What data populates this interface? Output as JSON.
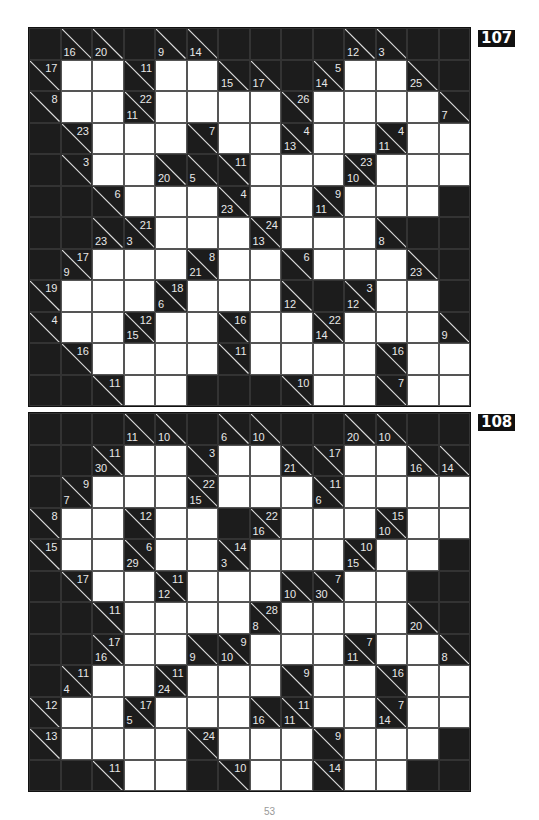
{
  "puzzles": [
    {
      "number": "107",
      "rows": [
        [
          "B",
          {
            "d": "16"
          },
          {
            "d": "20"
          },
          "B",
          {
            "d": "9"
          },
          {
            "d": "14"
          },
          "B",
          "B",
          "B",
          "B",
          {
            "d": "12"
          },
          {
            "d": "3"
          },
          "B",
          "B"
        ],
        [
          {
            "r": "17"
          },
          "W",
          "W",
          {
            "r": "11"
          },
          "W",
          "W",
          {
            "d": "15"
          },
          {
            "d": "17"
          },
          "B",
          {
            "d": "14",
            "r": "5"
          },
          "W",
          "W",
          {
            "d": "25"
          },
          "B"
        ],
        [
          {
            "r": "8"
          },
          "W",
          "W",
          {
            "d": "11",
            "r": "22"
          },
          "W",
          "W",
          "W",
          "W",
          {
            "r": "26"
          },
          "W",
          "W",
          "W",
          "W",
          {
            "d": "7"
          }
        ],
        [
          "B",
          {
            "r": "23"
          },
          "W",
          "W",
          "W",
          {
            "r": "7"
          },
          "W",
          "W",
          {
            "d": "13",
            "r": "4"
          },
          "W",
          "W",
          {
            "d": "11",
            "r": "4"
          },
          "W",
          "W"
        ],
        [
          "B",
          {
            "r": "3"
          },
          "W",
          "W",
          {
            "d": "20"
          },
          {
            "d": "5"
          },
          {
            "r": "11"
          },
          "W",
          "W",
          "W",
          {
            "d": "10",
            "r": "23"
          },
          "W",
          "W",
          "W"
        ],
        [
          "B",
          "B",
          {
            "r": "6"
          },
          "W",
          "W",
          "W",
          {
            "d": "23",
            "r": "4"
          },
          "W",
          "W",
          {
            "d": "11",
            "r": "9"
          },
          "W",
          "W",
          "W",
          "B"
        ],
        [
          "B",
          "B",
          {
            "d": "23"
          },
          {
            "d": "3",
            "r": "21"
          },
          "W",
          "W",
          "W",
          {
            "d": "13",
            "r": "24"
          },
          "W",
          "W",
          "W",
          {
            "d": "8"
          },
          "B",
          "B"
        ],
        [
          "B",
          {
            "d": "9",
            "r": "17"
          },
          "W",
          "W",
          "W",
          {
            "d": "21",
            "r": "8"
          },
          "W",
          "W",
          {
            "r": "6"
          },
          "W",
          "W",
          "W",
          {
            "d": "23"
          },
          "B"
        ],
        [
          {
            "r": "19"
          },
          "W",
          "W",
          "W",
          {
            "d": "6",
            "r": "18"
          },
          "W",
          "W",
          "W",
          {
            "d": "12"
          },
          "B",
          {
            "d": "12",
            "r": "3"
          },
          "W",
          "W",
          "B"
        ],
        [
          {
            "r": "4"
          },
          "W",
          "W",
          {
            "d": "15",
            "r": "12"
          },
          "W",
          "W",
          {
            "r": "16"
          },
          "W",
          "W",
          {
            "d": "14",
            "r": "22"
          },
          "W",
          "W",
          "W",
          {
            "d": "9"
          }
        ],
        [
          "B",
          {
            "r": "16"
          },
          "W",
          "W",
          "W",
          "W",
          {
            "r": "11"
          },
          "W",
          "W",
          "W",
          "W",
          {
            "r": "16"
          },
          "W",
          "W"
        ],
        [
          "B",
          "B",
          {
            "r": "11"
          },
          "W",
          "W",
          "B",
          "B",
          "B",
          {
            "r": "10"
          },
          "W",
          "W",
          {
            "r": "7"
          },
          "W",
          "W"
        ]
      ]
    },
    {
      "number": "108",
      "rows": [
        [
          "B",
          "B",
          "B",
          {
            "d": "11"
          },
          {
            "d": "10"
          },
          "B",
          {
            "d": "6"
          },
          {
            "d": "10"
          },
          "B",
          "B",
          {
            "d": "20"
          },
          {
            "d": "10"
          },
          "B",
          "B"
        ],
        [
          "B",
          "B",
          {
            "d": "30",
            "r": "11"
          },
          "W",
          "W",
          {
            "r": "3"
          },
          "W",
          "W",
          {
            "d": "21"
          },
          {
            "r": "17"
          },
          "W",
          "W",
          {
            "d": "16"
          },
          {
            "d": "14"
          }
        ],
        [
          "B",
          {
            "d": "7",
            "r": "9"
          },
          "W",
          "W",
          "W",
          {
            "d": "15",
            "r": "22"
          },
          "W",
          "W",
          "W",
          {
            "d": "6",
            "r": "11"
          },
          "W",
          "W",
          "W",
          "W"
        ],
        [
          {
            "r": "8"
          },
          "W",
          "W",
          {
            "r": "12"
          },
          "W",
          "W",
          "B",
          {
            "d": "16",
            "r": "22"
          },
          "W",
          "W",
          "W",
          {
            "d": "10",
            "r": "15"
          },
          "W",
          "W"
        ],
        [
          {
            "r": "15"
          },
          "W",
          "W",
          {
            "d": "29",
            "r": "6"
          },
          "W",
          "W",
          {
            "d": "3",
            "r": "14"
          },
          "W",
          "W",
          "W",
          {
            "d": "15",
            "r": "10"
          },
          "W",
          "W",
          "B"
        ],
        [
          "B",
          {
            "r": "17"
          },
          "W",
          "W",
          {
            "d": "12",
            "r": "11"
          },
          "W",
          "W",
          "W",
          {
            "d": "10"
          },
          {
            "d": "30",
            "r": "7"
          },
          "W",
          "W",
          "B",
          "B"
        ],
        [
          "B",
          "B",
          {
            "r": "11"
          },
          "W",
          "W",
          "W",
          "W",
          {
            "d": "8",
            "r": "28"
          },
          "W",
          "W",
          "W",
          "W",
          {
            "d": "20"
          },
          "B"
        ],
        [
          "B",
          "B",
          {
            "d": "16",
            "r": "17"
          },
          "W",
          "W",
          {
            "d": "9"
          },
          {
            "d": "10",
            "r": "9"
          },
          "W",
          "W",
          "W",
          {
            "d": "11",
            "r": "7"
          },
          "W",
          "W",
          {
            "d": "8"
          }
        ],
        [
          "B",
          {
            "d": "4",
            "r": "11"
          },
          "W",
          "W",
          {
            "d": "24",
            "r": "11"
          },
          "W",
          "W",
          "W",
          {
            "r": "9"
          },
          "W",
          "W",
          {
            "r": "16"
          },
          "W",
          "W"
        ],
        [
          {
            "r": "12"
          },
          "W",
          "W",
          {
            "d": "5",
            "r": "17"
          },
          "W",
          "W",
          "W",
          {
            "d": "16"
          },
          {
            "d": "11",
            "r": "11"
          },
          "W",
          "W",
          {
            "d": "14",
            "r": "7"
          },
          "W",
          "W"
        ],
        [
          {
            "r": "13"
          },
          "W",
          "W",
          "W",
          "W",
          {
            "r": "24"
          },
          "W",
          "W",
          "W",
          {
            "r": "9"
          },
          "W",
          "W",
          "W",
          "B"
        ],
        [
          "B",
          "B",
          {
            "r": "11"
          },
          "W",
          "W",
          "B",
          {
            "r": "10"
          },
          "W",
          "W",
          {
            "r": "14"
          },
          "W",
          "W",
          "B",
          "B"
        ]
      ]
    }
  ],
  "page_number": "53"
}
